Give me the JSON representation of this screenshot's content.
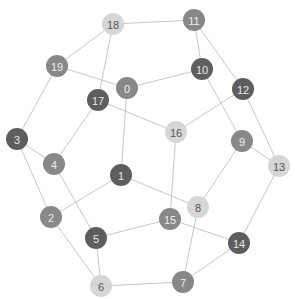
{
  "graph": {
    "title": "",
    "node_radius": 11,
    "palette": {
      "light": {
        "fill": "#d6d6d6",
        "text": "#555555"
      },
      "medium": {
        "fill": "#888888",
        "text": "#eeeeee"
      },
      "dark": {
        "fill": "#5e5e5e",
        "text": "#e8e8e8"
      }
    },
    "edge_color": "#c8c8c8",
    "nodes": [
      {
        "id": "0",
        "label": "0",
        "x": 127,
        "y": 88,
        "shade": "medium"
      },
      {
        "id": "1",
        "label": "1",
        "x": 121,
        "y": 175,
        "shade": "dark"
      },
      {
        "id": "2",
        "label": "2",
        "x": 51,
        "y": 217,
        "shade": "medium"
      },
      {
        "id": "3",
        "label": "3",
        "x": 17,
        "y": 139,
        "shade": "dark"
      },
      {
        "id": "4",
        "label": "4",
        "x": 54,
        "y": 164,
        "shade": "medium"
      },
      {
        "id": "5",
        "label": "5",
        "x": 96,
        "y": 238,
        "shade": "dark"
      },
      {
        "id": "6",
        "label": "6",
        "x": 101,
        "y": 286,
        "shade": "light"
      },
      {
        "id": "7",
        "label": "7",
        "x": 183,
        "y": 282,
        "shade": "medium"
      },
      {
        "id": "8",
        "label": "8",
        "x": 198,
        "y": 207,
        "shade": "light"
      },
      {
        "id": "9",
        "label": "9",
        "x": 242,
        "y": 141,
        "shade": "medium"
      },
      {
        "id": "10",
        "label": "10",
        "x": 202,
        "y": 69,
        "shade": "dark"
      },
      {
        "id": "11",
        "label": "11",
        "x": 194,
        "y": 20,
        "shade": "medium"
      },
      {
        "id": "12",
        "label": "12",
        "x": 243,
        "y": 89,
        "shade": "dark"
      },
      {
        "id": "13",
        "label": "13",
        "x": 279,
        "y": 166,
        "shade": "light"
      },
      {
        "id": "14",
        "label": "14",
        "x": 239,
        "y": 243,
        "shade": "dark"
      },
      {
        "id": "15",
        "label": "15",
        "x": 170,
        "y": 219,
        "shade": "medium"
      },
      {
        "id": "16",
        "label": "16",
        "x": 176,
        "y": 132,
        "shade": "light"
      },
      {
        "id": "17",
        "label": "17",
        "x": 98,
        "y": 100,
        "shade": "dark"
      },
      {
        "id": "18",
        "label": "18",
        "x": 113,
        "y": 24,
        "shade": "light"
      },
      {
        "id": "19",
        "label": "19",
        "x": 57,
        "y": 66,
        "shade": "medium"
      }
    ],
    "edges": [
      [
        "18",
        "11"
      ],
      [
        "18",
        "19"
      ],
      [
        "18",
        "17"
      ],
      [
        "19",
        "0"
      ],
      [
        "19",
        "3"
      ],
      [
        "0",
        "10"
      ],
      [
        "0",
        "1"
      ],
      [
        "17",
        "16"
      ],
      [
        "17",
        "4"
      ],
      [
        "3",
        "4"
      ],
      [
        "3",
        "2"
      ],
      [
        "4",
        "5"
      ],
      [
        "1",
        "2"
      ],
      [
        "1",
        "8"
      ],
      [
        "2",
        "6"
      ],
      [
        "5",
        "6"
      ],
      [
        "5",
        "15"
      ],
      [
        "6",
        "7"
      ],
      [
        "7",
        "14"
      ],
      [
        "7",
        "8"
      ],
      [
        "15",
        "16"
      ],
      [
        "15",
        "14"
      ],
      [
        "8",
        "9"
      ],
      [
        "9",
        "13"
      ],
      [
        "9",
        "10"
      ],
      [
        "10",
        "11"
      ],
      [
        "11",
        "12"
      ],
      [
        "12",
        "16"
      ],
      [
        "12",
        "13"
      ],
      [
        "13",
        "14"
      ]
    ]
  }
}
